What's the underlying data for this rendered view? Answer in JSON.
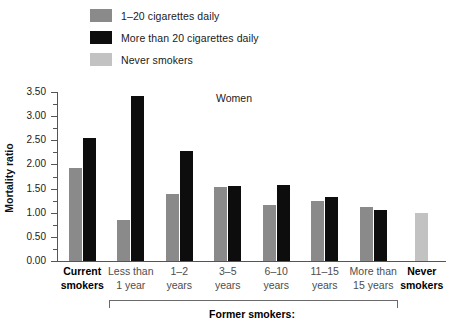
{
  "chart_data": {
    "type": "bar",
    "title": "",
    "annotation": "Women",
    "xlabel": "",
    "ylabel": "Mortality ratio",
    "ylim": [
      0,
      3.5
    ],
    "ytick_step": 0.5,
    "yminor_step": 0.25,
    "grid": false,
    "legend_position": "top-left",
    "categories": [
      "Current smokers",
      "Less than 1 year",
      "1–2 years",
      "3–5 years",
      "6–10 years",
      "11–15 years",
      "More than 15 years",
      "Never smokers"
    ],
    "category_lines": [
      [
        "Current",
        "smokers"
      ],
      [
        "Less than",
        "1 year"
      ],
      [
        "1–2",
        "years"
      ],
      [
        "3–5",
        "years"
      ],
      [
        "6–10",
        "years"
      ],
      [
        "11–15",
        "years"
      ],
      [
        "More than",
        "15 years"
      ],
      [
        "Never",
        "smokers"
      ]
    ],
    "category_bold": [
      true,
      false,
      false,
      false,
      false,
      false,
      false,
      true
    ],
    "group_bracket": {
      "label": "Former smokers:",
      "from_category": "Less than 1 year",
      "to_category": "More than 15 years"
    },
    "series": [
      {
        "name": "1–20 cigarettes daily",
        "color": "#8a8a8a",
        "values": [
          1.92,
          0.85,
          1.38,
          1.53,
          1.15,
          1.25,
          1.12,
          null
        ]
      },
      {
        "name": "More than 20 cigarettes daily",
        "color": "#0d0d0d",
        "values": [
          2.55,
          3.42,
          2.27,
          1.55,
          1.58,
          1.33,
          1.05,
          null
        ]
      },
      {
        "name": "Never smokers",
        "color": "#c2c2c2",
        "values": [
          null,
          null,
          null,
          null,
          null,
          null,
          null,
          1.0
        ]
      }
    ],
    "ytick_labels": [
      "0.00",
      "0.50",
      "1.00",
      "1.50",
      "2.00",
      "2.50",
      "3.00",
      "3.50"
    ],
    "ytick_values": [
      0.0,
      0.5,
      1.0,
      1.5,
      2.0,
      2.5,
      3.0,
      3.5
    ]
  },
  "legend": {
    "items": [
      {
        "label": "1–20 cigarettes daily",
        "color": "#8a8a8a"
      },
      {
        "label": "More than 20 cigarettes daily",
        "color": "#0d0d0d"
      },
      {
        "label": "Never smokers",
        "color": "#c2c2c2"
      }
    ]
  },
  "axis": {
    "y_title": "Mortality ratio"
  },
  "annotation": {
    "panel": "Women"
  },
  "bracket": {
    "label": "Former smokers:"
  }
}
